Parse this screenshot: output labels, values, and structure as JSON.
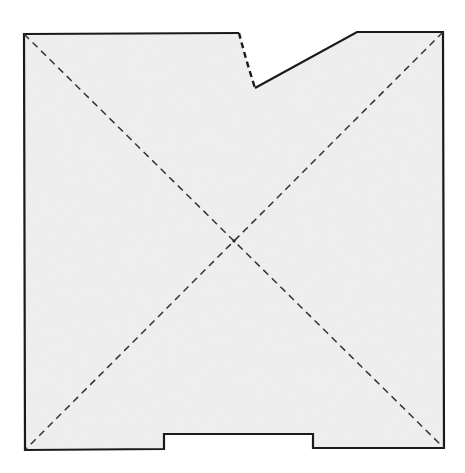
{
  "diagram": {
    "type": "pattern-piece",
    "background": "#ffffff",
    "fill": "#efefef",
    "stroke": "#1a1a1a",
    "dash_stroke": "#333333",
    "outline": {
      "points": [
        [
          24,
          34
        ],
        [
          239,
          33
        ],
        [
          255,
          88
        ],
        [
          357,
          32
        ],
        [
          443,
          32
        ],
        [
          444,
          448
        ],
        [
          313,
          448
        ],
        [
          313,
          434
        ],
        [
          164,
          434
        ],
        [
          164,
          449
        ],
        [
          25,
          450
        ]
      ],
      "dashed_segment": {
        "from": [
          239,
          33
        ],
        "to": [
          255,
          88
        ],
        "style": "dashed-curve"
      }
    },
    "diagonals": [
      {
        "from": [
          24,
          34
        ],
        "to": [
          444,
          448
        ],
        "style": "dashed"
      },
      {
        "from": [
          443,
          32
        ],
        "to": [
          25,
          450
        ],
        "style": "dashed"
      }
    ],
    "intersection": [
      234,
      241
    ]
  }
}
